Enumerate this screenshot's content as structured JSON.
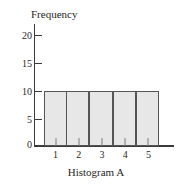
{
  "chart_data": {
    "type": "bar",
    "title": "Histogram A",
    "xlabel": "",
    "ylabel": "Frequency",
    "categories": [
      "1",
      "2",
      "3",
      "4",
      "5"
    ],
    "values": [
      10,
      10,
      10,
      10,
      10
    ],
    "ylim": [
      0,
      22
    ],
    "y_ticks": [
      {
        "value": 0,
        "label": "0"
      },
      {
        "value": 5,
        "label": "5"
      },
      {
        "value": 10,
        "label": "10"
      },
      {
        "value": 15,
        "label": "15"
      },
      {
        "value": 20,
        "label": "20"
      }
    ],
    "grid": false,
    "legend": false,
    "colors": {
      "bar_fill": "#e7e7e7",
      "bar_border": "#555555",
      "axis": "#3a3a3a",
      "text": "#262626",
      "background": "#ffffff"
    }
  }
}
